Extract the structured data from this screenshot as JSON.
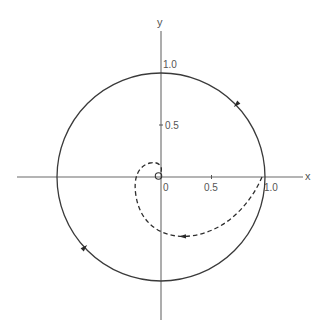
{
  "figure": {
    "type": "phase-plane diagram",
    "axes": {
      "x_label": "x",
      "y_label": "y",
      "x_ticks": [
        {
          "value": 0,
          "label": "0"
        },
        {
          "value": 0.5,
          "label": "0.5"
        },
        {
          "value": 1.0,
          "label": "1.0"
        }
      ],
      "y_ticks": [
        {
          "value": 0.5,
          "label": "0.5"
        },
        {
          "value": 1.0,
          "label": "1.0"
        }
      ],
      "origin_label": "0"
    },
    "curves": [
      {
        "name": "unit-circle",
        "style": "solid",
        "description": "Circle of radius 1.0 centered at the origin, traversed clockwise",
        "direction_arrows": [
          {
            "at": "upper-right quadrant",
            "direction": "clockwise"
          },
          {
            "at": "lower-left quadrant",
            "direction": "clockwise"
          }
        ]
      },
      {
        "name": "spiral-trajectory",
        "style": "dashed",
        "description": "Trajectory starting at (1.0, 0), spiralling clockwise inward to the origin",
        "start": [
          1.0,
          0
        ],
        "end": [
          0,
          0
        ],
        "direction_arrows": [
          {
            "at": "bottom of spiral",
            "direction": "clockwise"
          }
        ]
      }
    ],
    "markers": [
      {
        "name": "origin-small-circle",
        "at": [
          0,
          0
        ]
      }
    ]
  }
}
